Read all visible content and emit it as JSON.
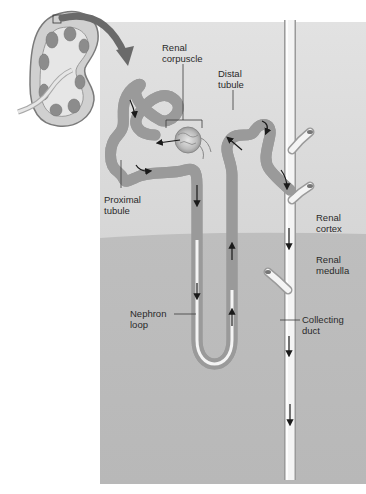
{
  "diagram": {
    "regions": {
      "cortex": {
        "label": "Renal\ncortex",
        "color": "#dcdcdc"
      },
      "medulla": {
        "label": "Renal\nmedulla",
        "color": "#bdbdbd"
      }
    },
    "labels": {
      "renal_corpuscle": "Renal\ncorpuscle",
      "distal_tubule": "Distal\ntubule",
      "proximal_tubule": "Proximal\ntubule",
      "renal_cortex": "Renal\ncortex",
      "renal_medulla": "Renal\nmedulla",
      "nephron_loop": "Nephron\nloop",
      "collecting_duct": "Collecting\nduct"
    },
    "colors": {
      "background": "#ffffff",
      "tubule_fill": "#f4f4f4",
      "tubule_edge": "#9a9a9a",
      "arrow": "#1a1a1a",
      "leader": "#3a3a3a",
      "kidney_outer": "#a8a8a8",
      "kidney_pyramid": "#8c8c8c"
    }
  }
}
